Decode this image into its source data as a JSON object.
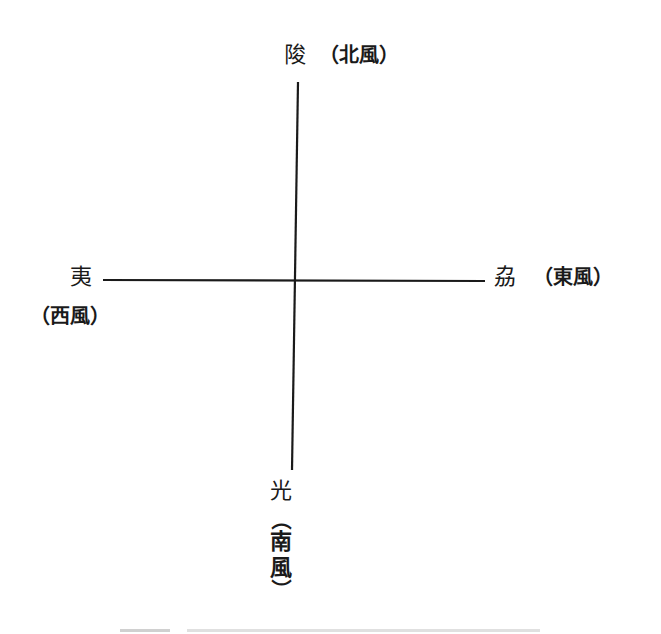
{
  "diagram": {
    "type": "four-direction cross (compass of winds)",
    "north": {
      "glyph": "陖",
      "gloss": "（北風）"
    },
    "west": {
      "glyph": "夷",
      "gloss": "（西風）"
    },
    "east": {
      "glyph": "劦",
      "gloss": "（東風）"
    },
    "south": {
      "glyph": "光",
      "gloss_open": "（",
      "gloss_chars": [
        "南",
        "風"
      ],
      "gloss_close": "）"
    }
  },
  "colors": {
    "ink": "#1a1a1a",
    "background": "#ffffff"
  }
}
